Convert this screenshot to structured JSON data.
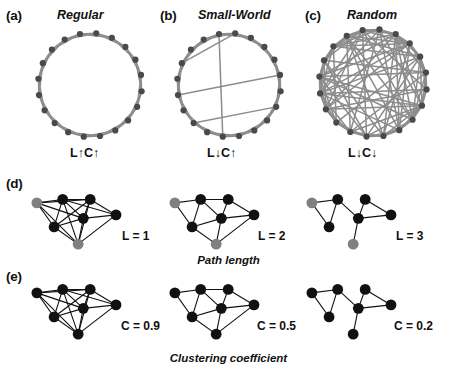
{
  "figure": {
    "background": "#ffffff",
    "node_color_dark": "#111111",
    "node_color_gray": "#808080",
    "edge_color_ring": "#8c8c8c",
    "edge_color_dark": "#111111"
  },
  "top_row": {
    "panels": [
      {
        "letter": "(a)",
        "title": "Regular",
        "metric": "L↑C↑",
        "path_length_arrow": "↑",
        "clustering_arrow": "↑",
        "nodes": 20,
        "graph_type": "ring-lattice",
        "neighbors_each_side": 2,
        "shortcuts": 0
      },
      {
        "letter": "(b)",
        "title": "Small-World",
        "metric": "L↓C↑",
        "path_length_arrow": "↓",
        "clustering_arrow": "↑",
        "nodes": 20,
        "graph_type": "small-world",
        "neighbors_each_side": 2,
        "shortcuts": 4
      },
      {
        "letter": "(c)",
        "title": "Random",
        "metric": "L↓C↓",
        "path_length_arrow": "↓",
        "clustering_arrow": "↓",
        "nodes": 20,
        "graph_type": "random",
        "neighbors_each_side": 2,
        "shortcuts": 60
      }
    ]
  },
  "path_length_row": {
    "letter": "(d)",
    "caption": "Path length",
    "graphs": [
      {
        "label": "L = 1",
        "value": 1,
        "edge_count": 17,
        "highlighted_nodes": 2
      },
      {
        "label": "L = 2",
        "value": 2,
        "edge_count": 12,
        "highlighted_nodes": 2
      },
      {
        "label": "L = 3",
        "value": 3,
        "edge_count": 8,
        "highlighted_nodes": 2
      }
    ]
  },
  "clustering_row": {
    "letter": "(e)",
    "caption": "Clustering coefficient",
    "graphs": [
      {
        "label": "C = 0.9",
        "value": 0.9,
        "edge_count": 17,
        "highlighted_nodes": 0
      },
      {
        "label": "C = 0.5",
        "value": 0.5,
        "edge_count": 12,
        "highlighted_nodes": 0
      },
      {
        "label": "C = 0.2",
        "value": 0.2,
        "edge_count": 8,
        "highlighted_nodes": 0
      }
    ]
  }
}
